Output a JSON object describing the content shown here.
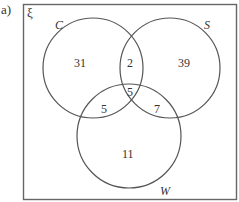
{
  "part_label": "a)",
  "universal_symbol": "ξ",
  "sets": {
    "C": {
      "label": "C"
    },
    "S": {
      "label": "S"
    },
    "W": {
      "label": "W"
    }
  },
  "regions": {
    "C_only": "31",
    "S_only": "39",
    "W_only": "11",
    "C_and_S_only": "2",
    "C_and_W_only": "5",
    "S_and_W_only": "7",
    "C_S_W": "5"
  },
  "colors": {
    "stroke": "#555555",
    "text": "#333333",
    "background": "#ffffff"
  }
}
